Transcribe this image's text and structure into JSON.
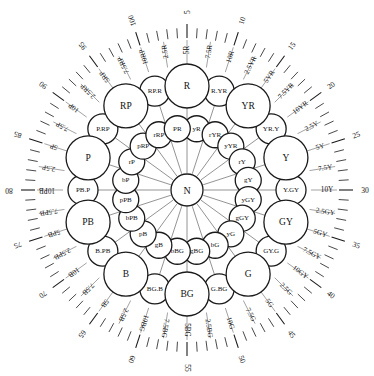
{
  "figure": {
    "center_label": "N",
    "type": "munsell-hue-circle",
    "line_color": "#1a1a1a",
    "background": "#ffffff"
  },
  "chart_data": {
    "type": "scatter",
    "xlabel": "",
    "ylabel": "",
    "grid": false,
    "legend": null,
    "center": {
      "label": "N",
      "radius": 16
    },
    "rings": [
      {
        "name": "principal",
        "radius": 104,
        "circle_radius": 22,
        "labels": [
          "R",
          "YR",
          "Y",
          "GY",
          "G",
          "BG",
          "B",
          "PB",
          "P",
          "RP"
        ]
      },
      {
        "name": "intermediate",
        "radius": 104,
        "circle_radius": 15,
        "labels": [
          "R.YR",
          "YR.Y",
          "Y.GY",
          "GY.G",
          "G.BG",
          "BG.B",
          "B.PB",
          "PB.P",
          "P.RP",
          "RP.R"
        ]
      },
      {
        "name": "inner",
        "radius": 62,
        "circle_radius": 13,
        "labels": [
          "yR",
          "rYR",
          "yYR",
          "rY",
          "gY",
          "yGY",
          "gGY",
          "yG",
          "bG",
          "gBG",
          "bBG",
          "gB",
          "pB",
          "bPB",
          "pPB",
          "bP",
          "rP",
          "pRP",
          "rRP",
          "PR"
        ]
      }
    ],
    "hue_names_40": [
      "5R",
      "7.5R",
      "10R",
      "2.5YR",
      "5YR",
      "7.5YR",
      "10YR",
      "2.5Y",
      "5Y",
      "7.5Y",
      "10Y",
      "2.5GY",
      "5GY",
      "7.5GY",
      "10GY",
      "2.5G",
      "5G",
      "7.5G",
      "10G",
      "2.5BG",
      "5BG",
      "7.5BG",
      "10BG",
      "2.5B",
      "5B",
      "7.5B",
      "10B",
      "2.5PB",
      "5PB",
      "7.5PB",
      "10PB",
      "2.5P",
      "5P",
      "7.5P",
      "10P",
      "2.5RP",
      "5RP",
      "7.5RP",
      "10RP",
      "2.5R"
    ],
    "scale_numbers": [
      5,
      10,
      15,
      20,
      25,
      30,
      35,
      40,
      45,
      50,
      55,
      60,
      65,
      70,
      75,
      80,
      85,
      90,
      95,
      100
    ],
    "scale_number_hue": {
      "5": "5R",
      "10": "10R",
      "15": "5YR",
      "20": "10YR",
      "25": "5Y",
      "30": "10Y",
      "35": "5GY",
      "40": "10GY",
      "45": "5G",
      "50": "10G",
      "55": "5BG",
      "60": "10BG",
      "65": "5B",
      "70": "10B",
      "75": "5PB",
      "80": "10PB",
      "85": "5P",
      "90": "10P",
      "95": "5RP",
      "100": "10RP"
    },
    "spokes": 20,
    "tick_count": 100
  }
}
